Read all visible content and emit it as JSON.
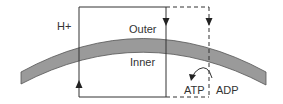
{
  "diagram": {
    "labels": {
      "proton": "H+",
      "outer": "Outer",
      "inner": "Inner",
      "atp": "ATP",
      "adp": "ADP"
    },
    "colors": {
      "membrane_fill": "#9a9a9a",
      "membrane_edge": "#555555",
      "line": "#333333",
      "text": "#333333",
      "background": "#ffffff"
    }
  }
}
